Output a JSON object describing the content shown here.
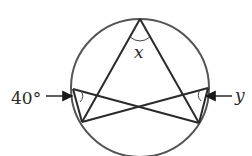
{
  "diagram": {
    "type": "inscribed-angles-circle",
    "labels": {
      "top_angle": "x",
      "left_angle": "40°",
      "right_angle": "y"
    },
    "colors": {
      "stroke": "#2a2a2a",
      "circle": "#555555",
      "background": "#ffffff"
    }
  }
}
